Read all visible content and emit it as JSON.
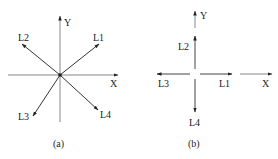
{
  "diagram_a": {
    "caption": "(a)",
    "axes": {
      "x_label": "X",
      "y_label": "Y"
    },
    "vectors": [
      {
        "label": "L1",
        "direction": "up-right"
      },
      {
        "label": "L2",
        "direction": "up-left"
      },
      {
        "label": "L3",
        "direction": "down-left"
      },
      {
        "label": "L4",
        "direction": "down-right"
      }
    ]
  },
  "diagram_b": {
    "caption": "(b)",
    "axes": {
      "x_label": "X",
      "y_label": "Y"
    },
    "vectors": [
      {
        "label": "L1",
        "direction": "right"
      },
      {
        "label": "L2",
        "direction": "up"
      },
      {
        "label": "L3",
        "direction": "left"
      },
      {
        "label": "L4",
        "direction": "down"
      }
    ]
  },
  "colors": {
    "axis": "#888888",
    "vector": "#333333",
    "text": "#222222"
  }
}
